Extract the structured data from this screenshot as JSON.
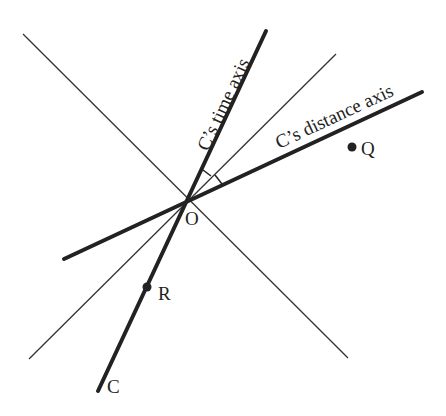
{
  "diagram": {
    "title": "",
    "colors": {
      "background": "#ffffff",
      "ink": "#222222",
      "thin_line": "#333333"
    },
    "origin": {
      "label": "O",
      "x": 187,
      "y": 200
    },
    "lines": [
      {
        "id": "light-line-1",
        "kind": "thin",
        "x1": 23,
        "y1": 34,
        "x2": 348,
        "y2": 358
      },
      {
        "id": "light-line-2",
        "kind": "thin",
        "x1": 29,
        "y1": 359,
        "x2": 336,
        "y2": 54
      },
      {
        "id": "time-axis",
        "kind": "thick",
        "x1": 98,
        "y1": 391,
        "x2": 266,
        "y2": 31
      },
      {
        "id": "distance-axis",
        "kind": "thick",
        "x1": 64,
        "y1": 259,
        "x2": 422,
        "y2": 92
      }
    ],
    "axis_labels": {
      "time_axis": "C’s time axis",
      "distance_axis": "C’s distance axis"
    },
    "points": [
      {
        "label": "Q",
        "x": 352,
        "y": 147
      },
      {
        "label": "R",
        "x": 147,
        "y": 287
      }
    ],
    "worldline_label": "C",
    "angle_marks": [
      {
        "between": [
          "time-axis",
          "light-line-2"
        ]
      },
      {
        "between": [
          "light-line-2",
          "distance-axis"
        ]
      }
    ]
  }
}
